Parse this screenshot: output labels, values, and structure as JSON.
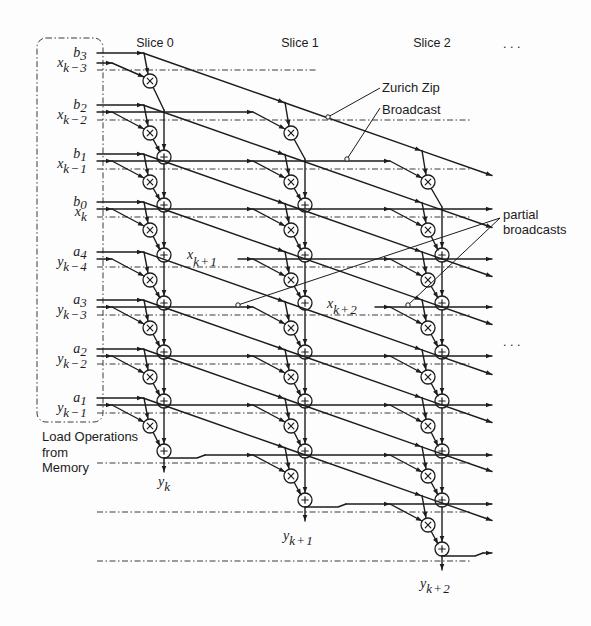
{
  "figure": {
    "slice_labels": [
      "Slice 0",
      "Slice 1",
      "Slice 2"
    ],
    "ellipsis": ". . .",
    "coefficients": [
      {
        "base": "b",
        "sub": "3"
      },
      {
        "base": "b",
        "sub": "2"
      },
      {
        "base": "b",
        "sub": "1"
      },
      {
        "base": "b",
        "sub": "0"
      },
      {
        "base": "a",
        "sub": "4"
      },
      {
        "base": "a",
        "sub": "3"
      },
      {
        "base": "a",
        "sub": "2"
      },
      {
        "base": "a",
        "sub": "1"
      }
    ],
    "row_inputs": [
      {
        "base": "x",
        "sub": "k−3"
      },
      {
        "base": "x",
        "sub": "k−2"
      },
      {
        "base": "x",
        "sub": "k−1"
      },
      {
        "base": "x",
        "sub": "k"
      },
      {
        "base": "y",
        "sub": "k−4"
      },
      {
        "base": "y",
        "sub": "k−3"
      },
      {
        "base": "y",
        "sub": "k−2"
      },
      {
        "base": "y",
        "sub": "k−1"
      }
    ],
    "partial_inputs": [
      {
        "base": "x",
        "sub": "k+1"
      },
      {
        "base": "x",
        "sub": "k+2"
      }
    ],
    "outputs": [
      {
        "base": "y",
        "sub": "k"
      },
      {
        "base": "y",
        "sub": "k+1"
      },
      {
        "base": "y",
        "sub": "k+2"
      }
    ],
    "load_label": [
      "Load Operations",
      "from",
      "Memory"
    ],
    "annotations": {
      "zurich_zip": "Zurich Zip",
      "broadcast": "Broadcast",
      "partial_broadcasts": [
        "partial",
        "broadcasts"
      ]
    },
    "operators": {
      "multiply": "×",
      "add": "+"
    },
    "data_lines": [
      {
        "row": 0,
        "input": "x_{k-3}",
        "start": "memory",
        "slices": [
          0
        ],
        "continues": false
      },
      {
        "row": 1,
        "input": "x_{k-2}",
        "start": "memory",
        "slices": [
          0,
          1
        ],
        "continues": false
      },
      {
        "row": 2,
        "input": "x_{k-1}",
        "start": "memory",
        "slices": [
          0,
          1,
          2
        ],
        "continues": false
      },
      {
        "row": 3,
        "input": "x_k",
        "start": "memory",
        "slices": [
          0,
          1,
          2
        ],
        "continues": true
      },
      {
        "row": 4,
        "input": "y_{k-4}",
        "start": "memory",
        "slices": [
          0
        ],
        "continues": false
      },
      {
        "row": 4,
        "input": "x_{k+1}",
        "start": "partial",
        "slices": [
          1,
          2
        ],
        "continues": true
      },
      {
        "row": 5,
        "input": "y_{k-3}",
        "start": "memory",
        "slices": [
          0,
          1
        ],
        "continues": false
      },
      {
        "row": 5,
        "input": "x_{k+2}",
        "start": "partial",
        "slices": [
          2
        ],
        "continues": true
      },
      {
        "row": 6,
        "input": "y_{k-2}",
        "start": "memory",
        "slices": [
          0,
          1,
          2
        ],
        "continues": true
      },
      {
        "row": 7,
        "input": "y_{k-1}",
        "start": "memory",
        "slices": [
          0,
          1,
          2
        ],
        "continues": true
      },
      {
        "row": 8,
        "input": "y_k",
        "start": "slice_output",
        "from_slice": 0,
        "slices": [
          1,
          2
        ],
        "continues": true
      },
      {
        "row": 9,
        "input": "y_{k+1}",
        "start": "slice_output",
        "from_slice": 1,
        "slices": [
          2
        ],
        "continues": true
      },
      {
        "row": 10,
        "input": "y_{k+2}",
        "start": "slice_output",
        "from_slice": 2,
        "slices": [],
        "continues": true
      }
    ]
  }
}
